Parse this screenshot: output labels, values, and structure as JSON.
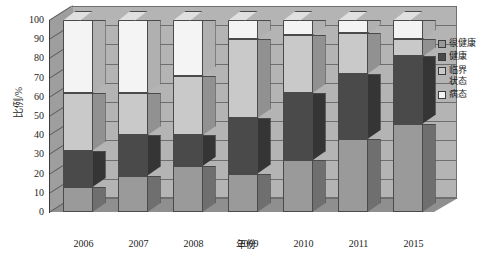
{
  "chart_data": {
    "type": "bar",
    "subtype": "stacked-column-3d",
    "title": "",
    "xlabel": "年份",
    "ylabel": "比例/%",
    "categories": [
      "2006",
      "2007",
      "2008",
      "2009",
      "2010",
      "2011",
      "2015"
    ],
    "ylim": [
      0,
      100
    ],
    "yticks": [
      0,
      10,
      20,
      30,
      40,
      50,
      60,
      70,
      80,
      90,
      100
    ],
    "grid": true,
    "legend_position": "right",
    "stacked": true,
    "series": [
      {
        "name": "很健康",
        "color": "#9a9a9a",
        "values": [
          13,
          19,
          24,
          20,
          27,
          38,
          46
        ]
      },
      {
        "name": "健康",
        "color": "#4a4a4a",
        "values": [
          19,
          21,
          16,
          29,
          35,
          34,
          35
        ]
      },
      {
        "name": "临界状态",
        "color": "#c9c9c9",
        "values": [
          30,
          22,
          31,
          41,
          30,
          21,
          9
        ]
      },
      {
        "name": "病态",
        "color": "#f4f4f4",
        "values": [
          38,
          38,
          29,
          10,
          8,
          7,
          10
        ]
      }
    ],
    "cumulative_tops": {
      "2006": [
        13,
        32,
        62,
        100
      ],
      "2007": [
        19,
        40,
        62,
        100
      ],
      "2008": [
        24,
        40,
        71,
        100
      ],
      "2009": [
        20,
        49,
        90,
        100
      ],
      "2010": [
        27,
        62,
        92,
        100
      ],
      "2011": [
        38,
        72,
        93,
        100
      ],
      "2015": [
        46,
        81,
        90,
        100
      ]
    }
  },
  "legend": {
    "items": [
      {
        "label": "很健康",
        "color": "#9a9a9a"
      },
      {
        "label": "健康",
        "color": "#4a4a4a"
      },
      {
        "label": "临界\n状态",
        "color": "#c9c9c9"
      },
      {
        "label": "病态",
        "color": "#f4f4f4"
      }
    ]
  },
  "axes": {
    "y_title": "比例/%",
    "x_title": "年份"
  },
  "colors": {
    "back_wall": "#b4b4b4",
    "left_wall": "#9e9e9e",
    "floor": "#8f8f8f",
    "gridline": "#6e6e6e",
    "outline": "#4a4a4a",
    "text": "#1c1c1c",
    "background": "#ffffff"
  }
}
